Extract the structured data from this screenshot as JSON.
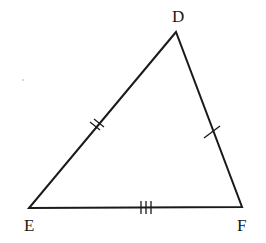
{
  "diagram": {
    "type": "triangle",
    "vertices": [
      {
        "label": "D",
        "x": 176,
        "y": 32
      },
      {
        "label": "E",
        "x": 29,
        "y": 208
      },
      {
        "label": "F",
        "x": 242,
        "y": 207
      }
    ],
    "sides": [
      {
        "name": "DE",
        "tick_marks": 2
      },
      {
        "name": "DF",
        "tick_marks": 1
      },
      {
        "name": "EF",
        "tick_marks": 3
      }
    ],
    "stroke_color": "#1a1a1a"
  },
  "labels": {
    "d": "D",
    "e": "E",
    "f": "F"
  }
}
